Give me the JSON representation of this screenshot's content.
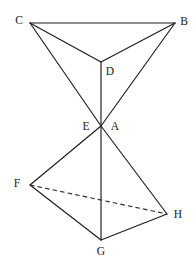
{
  "figure": {
    "background_color": "#ffffff",
    "stroke_color": "#1c1c1c",
    "dashed_stroke_color": "#2a2a2a",
    "label_color": "#1a1a1a",
    "width": 195,
    "height": 267
  },
  "vertices": [
    {
      "id": "C",
      "label": "C",
      "x": 30,
      "y": 23,
      "label_x": 19,
      "label_y": 21
    },
    {
      "id": "B",
      "label": "B",
      "x": 175,
      "y": 23,
      "label_x": 184,
      "label_y": 22
    },
    {
      "id": "D",
      "label": "D",
      "x": 101,
      "y": 62,
      "label_x": 110,
      "label_y": 72
    },
    {
      "id": "E",
      "label": "E",
      "x": 101,
      "y": 126,
      "label_x": 86,
      "label_y": 127
    },
    {
      "id": "A",
      "label": "A",
      "x": 101,
      "y": 126,
      "label_x": 115,
      "label_y": 127
    },
    {
      "id": "F",
      "label": "F",
      "x": 30,
      "y": 185,
      "label_x": 17,
      "label_y": 184
    },
    {
      "id": "H",
      "label": "H",
      "x": 167,
      "y": 214,
      "label_x": 178,
      "label_y": 215
    },
    {
      "id": "G",
      "label": "G",
      "x": 101,
      "y": 240,
      "label_x": 101,
      "label_y": 252
    }
  ],
  "edges": [
    {
      "id": "C-B",
      "from": "C",
      "to": "B",
      "style": "solid",
      "x1": 30,
      "y1": 23,
      "x2": 175,
      "y2": 23
    },
    {
      "id": "C-D",
      "from": "C",
      "to": "D",
      "style": "solid",
      "x1": 30,
      "y1": 23,
      "x2": 101,
      "y2": 62
    },
    {
      "id": "B-D",
      "from": "B",
      "to": "D",
      "style": "solid",
      "x1": 175,
      "y1": 23,
      "x2": 101,
      "y2": 62
    },
    {
      "id": "C-A",
      "from": "C",
      "to": "A",
      "style": "solid",
      "x1": 30,
      "y1": 23,
      "x2": 101,
      "y2": 126
    },
    {
      "id": "B-A",
      "from": "B",
      "to": "A",
      "style": "solid",
      "x1": 175,
      "y1": 23,
      "x2": 101,
      "y2": 126
    },
    {
      "id": "D-A",
      "from": "D",
      "to": "A",
      "style": "solid",
      "x1": 101,
      "y1": 62,
      "x2": 101,
      "y2": 126
    },
    {
      "id": "E-F",
      "from": "E",
      "to": "F",
      "style": "solid",
      "x1": 101,
      "y1": 126,
      "x2": 30,
      "y2": 185
    },
    {
      "id": "E-H",
      "from": "E",
      "to": "H",
      "style": "solid",
      "x1": 101,
      "y1": 126,
      "x2": 167,
      "y2": 214
    },
    {
      "id": "E-G",
      "from": "E",
      "to": "G",
      "style": "solid",
      "x1": 101,
      "y1": 126,
      "x2": 101,
      "y2": 240
    },
    {
      "id": "F-G",
      "from": "F",
      "to": "G",
      "style": "solid",
      "x1": 30,
      "y1": 185,
      "x2": 101,
      "y2": 240
    },
    {
      "id": "G-H",
      "from": "G",
      "to": "H",
      "style": "solid",
      "x1": 101,
      "y1": 240,
      "x2": 167,
      "y2": 214
    },
    {
      "id": "F-H",
      "from": "F",
      "to": "H",
      "style": "dashed",
      "x1": 30,
      "y1": 185,
      "x2": 167,
      "y2": 214
    }
  ]
}
